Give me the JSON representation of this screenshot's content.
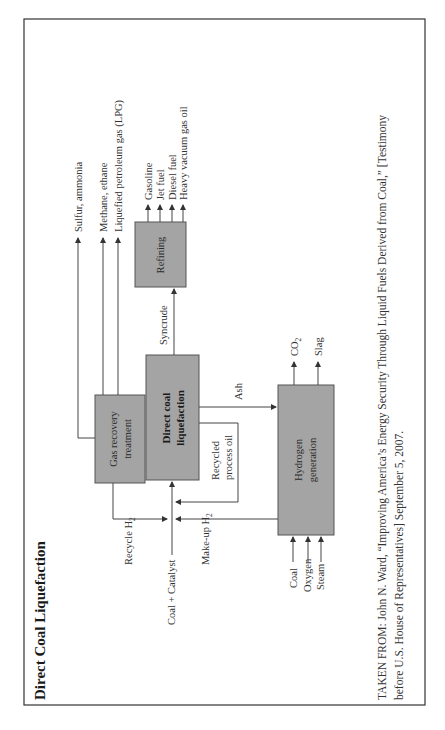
{
  "page_header": "Coal Sources of Fuel Can Best Reduce Pollution",
  "figure": {
    "title": "Direct Coal Liquefaction",
    "orientation": "rotated-90-ccw",
    "boxes": {
      "gas_recovery": "Gas recovery treatment",
      "gas_recovery_line1": "Gas recovery",
      "gas_recovery_line2": "treatment",
      "liquefaction_line1": "Direct coal",
      "liquefaction_line2": "liquefaction",
      "refining": "Refining",
      "hydrogen_line1": "Hydrogen",
      "hydrogen_line2": "generation"
    },
    "gas_outputs": [
      "Sulfur, ammonia",
      "Methane, ethane",
      "Liquefied petroleum gas (LPG)"
    ],
    "refining_outputs": [
      "Gasoline",
      "Jet fuel",
      "Diesel fuel",
      "Heavy vacuum gas oil"
    ],
    "hydrogen_outputs": {
      "co2": "CO",
      "co2_sub": "2",
      "slag": "Slag"
    },
    "hydrogen_inputs": [
      "Coal",
      "Oxygen",
      "Steam"
    ],
    "flows": {
      "syncrude": "Syncrude",
      "ash": "Ash",
      "recycled_oil_line1": "Recycled",
      "recycled_oil_line2": "process oil",
      "recycle_h2": "Recycle H",
      "recycle_h2_sub": "2",
      "makeup_h2": "Make-up H",
      "makeup_h2_sub": "2",
      "coal_catalyst": "Coal + Catalyst"
    },
    "source_line1": "TAKEN FROM: John N. Ward, “Improving America’s Energy Security Through Liquid Fuels Derived from Coal,” [Testimony",
    "source_line2": "before U.S. House of Representatives] September 5, 2007."
  },
  "colors": {
    "box_fill": "#a4a4a4",
    "line": "#444444",
    "frame": "#333333"
  }
}
